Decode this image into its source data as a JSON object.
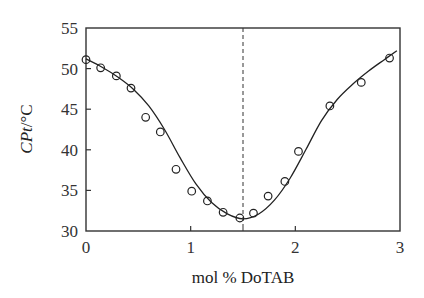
{
  "chart_data": {
    "type": "scatter",
    "title": "",
    "xlabel": "mol % DoTAB",
    "ylabel": {
      "italic": "CPt",
      "rest": "/°C"
    },
    "xlim": [
      0,
      3
    ],
    "ylim": [
      30,
      55
    ],
    "xticks": [
      0,
      1,
      2,
      3
    ],
    "yticks": [
      30,
      35,
      40,
      45,
      50,
      55
    ],
    "grid": false,
    "legend": null,
    "series": [
      {
        "name": "measured",
        "marker": "open-circle",
        "x": [
          0.0,
          0.14,
          0.29,
          0.43,
          0.57,
          0.71,
          0.86,
          1.01,
          1.16,
          1.31,
          1.47,
          1.6,
          1.74,
          1.9,
          2.03,
          2.33,
          2.63,
          2.9
        ],
        "y": [
          51.1,
          50.1,
          49.1,
          47.6,
          44.0,
          42.2,
          37.6,
          34.9,
          33.7,
          32.3,
          31.6,
          32.2,
          34.3,
          36.1,
          39.8,
          45.4,
          48.3,
          51.3
        ]
      },
      {
        "name": "fit",
        "style": "solid-line",
        "x": [
          0.0,
          0.15,
          0.3,
          0.45,
          0.6,
          0.75,
          0.9,
          1.05,
          1.2,
          1.35,
          1.5,
          1.65,
          1.8,
          1.95,
          2.1,
          2.25,
          2.4,
          2.55,
          2.7,
          2.85,
          2.97
        ],
        "y": [
          51.2,
          50.2,
          49.0,
          47.5,
          45.4,
          42.5,
          39.0,
          35.8,
          33.5,
          32.1,
          31.5,
          32.1,
          33.8,
          36.5,
          40.0,
          43.6,
          46.2,
          48.1,
          49.7,
          51.1,
          52.2
        ]
      }
    ],
    "annotations": [
      {
        "type": "vertical-dashed-line",
        "x": 1.5
      }
    ]
  }
}
